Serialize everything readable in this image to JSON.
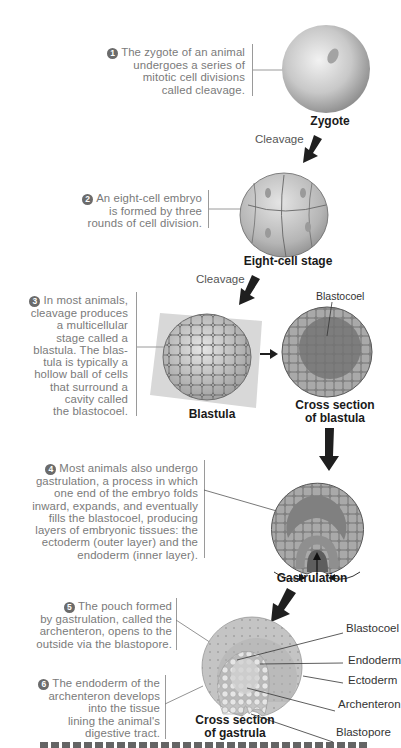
{
  "figure": {
    "steps": [
      {
        "number": "1",
        "text_lines": [
          "The zygote of an animal",
          "undergoes a series of",
          "mitotic cell divisions",
          "called cleavage."
        ]
      },
      {
        "number": "2",
        "text_lines": [
          "An eight-cell embryo",
          "is formed by three",
          "rounds of cell division."
        ]
      },
      {
        "number": "3",
        "text_lines": [
          "In most animals,",
          "cleavage produces",
          "a multicellular",
          "stage called a",
          "blastula. The blas-",
          "tula is typically a",
          "hollow ball of cells",
          "that surround a",
          "cavity called",
          "the blastocoel."
        ]
      },
      {
        "number": "4",
        "text_lines": [
          "Most animals also undergo",
          "gastrulation, a process in which",
          "one end of the embryo folds",
          "inward, expands, and eventually",
          "fills the blastocoel, producing",
          "layers of embryonic tissues: the",
          "ectoderm (outer layer) and the",
          "endoderm (inner layer)."
        ]
      },
      {
        "number": "5",
        "text_lines": [
          "The pouch formed",
          "by gastrulation, called the",
          "archenteron, opens to the",
          "outside via the blastopore."
        ]
      },
      {
        "number": "6",
        "text_lines": [
          "The endoderm of the",
          "archenteron develops",
          "into the tissue",
          "lining the animal's",
          "digestive tract."
        ]
      }
    ],
    "stage_labels": {
      "zygote": "Zygote",
      "eight_cell": "Eight-cell stage",
      "blastula": "Blastula",
      "cross_blastula_1": "Cross section",
      "cross_blastula_2": "of blastula",
      "gastrulation": "Gastrulation",
      "cross_gastrula_1": "Cross section",
      "cross_gastrula_2": "of gastrula"
    },
    "arrow_labels": {
      "cleavage_1": "Cleavage",
      "cleavage_2": "Cleavage"
    },
    "structure_labels": {
      "blastocoel_blastula": "Blastocoel",
      "blastocoel": "Blastocoel",
      "endoderm": "Endoderm",
      "ectoderm": "Ectoderm",
      "archenteron": "Archenteron",
      "blastopore": "Blastopore"
    },
    "colors": {
      "cell_fill": "#b8b8b8",
      "cell_dark": "#8c8c8c",
      "caption_text": "#7a7a7a",
      "arrow": "#1f1f1f"
    }
  }
}
